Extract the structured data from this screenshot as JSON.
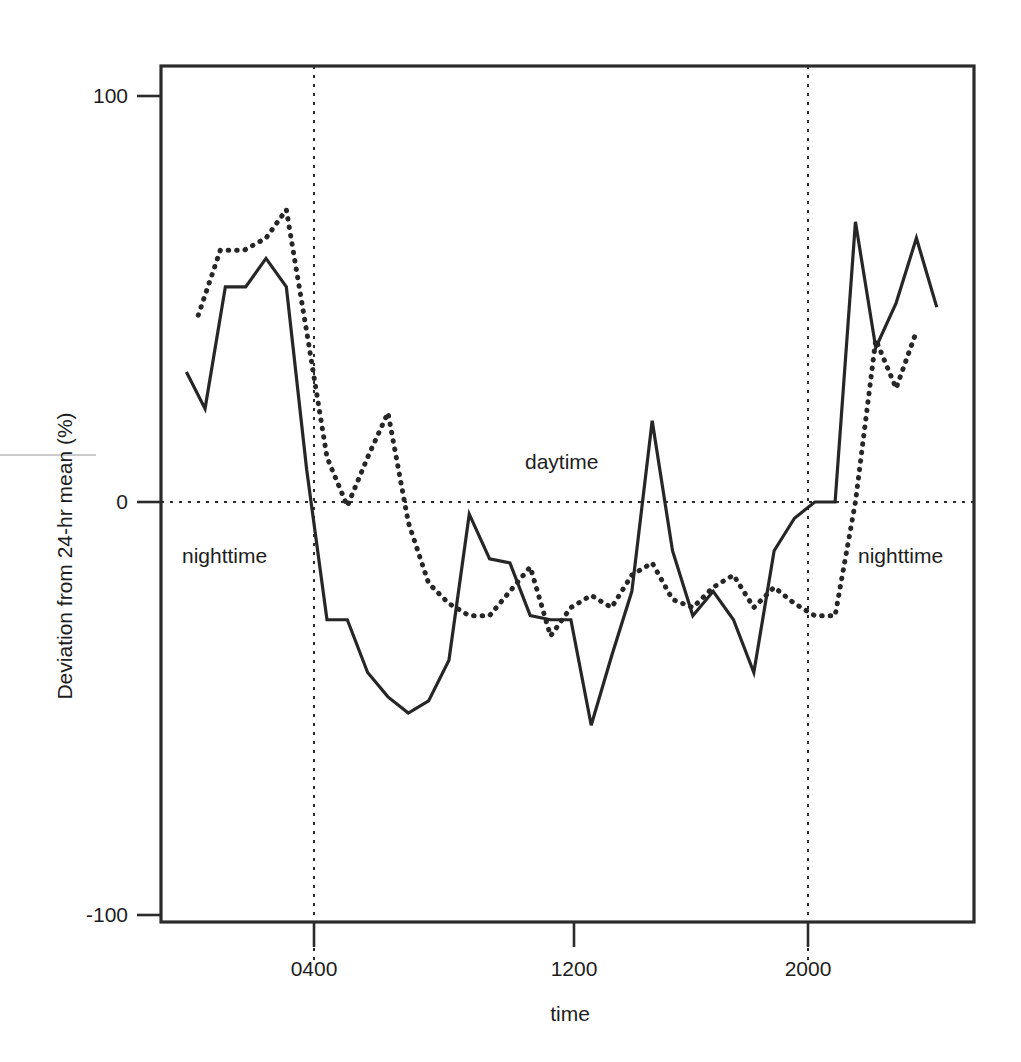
{
  "chart_data": {
    "type": "line",
    "title": "",
    "xlabel": "time",
    "ylabel": "Deviation from 24-hr mean (%)",
    "xlim": [
      0,
      2400
    ],
    "ylim": [
      -100,
      100
    ],
    "xticks": [
      400,
      1200,
      2000
    ],
    "xticklabels": [
      "0400",
      "1200",
      "2000"
    ],
    "yticks": [
      -100,
      0,
      100
    ],
    "yticklabels": [
      "-100",
      "0",
      "100"
    ],
    "grid": false,
    "zero_line": true,
    "legend": "none",
    "annotations": [
      {
        "text": "nighttime",
        "x": 290,
        "y": -17
      },
      {
        "text": "daytime",
        "x": 1100,
        "y": 10
      },
      {
        "text": "nighttime",
        "x": 2130,
        "y": -17
      }
    ],
    "vertical_markers": [
      {
        "label": "dawn",
        "x": 400
      },
      {
        "label": "dusk",
        "x": 2000
      }
    ],
    "series": [
      {
        "name": "solid",
        "style": "solid",
        "color": "#262626",
        "x": [
          75,
          130,
          190,
          250,
          310,
          370,
          430,
          490,
          550,
          610,
          670,
          730,
          790,
          850,
          910,
          970,
          1030,
          1090,
          1150,
          1210,
          1270,
          1330,
          1390,
          1450,
          1510,
          1570,
          1630,
          1690,
          1750,
          1810,
          1870,
          1930,
          1990,
          2050,
          2110,
          2170,
          2230,
          2290
        ],
        "y": [
          32,
          23,
          53,
          53,
          60,
          53,
          8,
          -29,
          -29,
          -42,
          -48,
          -52,
          -49,
          -39,
          -3,
          -14,
          -15,
          -28,
          -29,
          -29,
          -55,
          -38,
          -22,
          20,
          -12,
          -28,
          -22,
          -29,
          -42,
          -12,
          -4,
          0,
          0,
          69,
          38,
          49,
          65,
          48
        ]
      },
      {
        "name": "dotted",
        "style": "dotted",
        "color": "#262626",
        "x": [
          110,
          175,
          245,
          310,
          370,
          430,
          490,
          550,
          610,
          670,
          730,
          790,
          850,
          910,
          970,
          1030,
          1090,
          1150,
          1210,
          1270,
          1330,
          1390,
          1450,
          1510,
          1570,
          1630,
          1690,
          1750,
          1810,
          1870,
          1930,
          1990,
          2050,
          2110,
          2170,
          2230
        ],
        "y": [
          46,
          62,
          62,
          65,
          72,
          42,
          11,
          -1,
          11,
          22,
          -5,
          -20,
          -25,
          -28,
          -28,
          -22,
          -16,
          -33,
          -26,
          -23,
          -26,
          -18,
          -15,
          -24,
          -26,
          -21,
          -18,
          -26,
          -21,
          -25,
          -28,
          -28,
          0,
          40,
          28,
          42
        ]
      }
    ]
  },
  "axes": {
    "y_axis_title": "Deviation from 24-hr mean (%)",
    "x_axis_title": "time",
    "y_tick_100": "100",
    "y_tick_0": "0",
    "y_tick_neg100": "-100",
    "x_tick_0400": "0400",
    "x_tick_1200": "1200",
    "x_tick_2000": "2000"
  },
  "labels": {
    "nighttime_left": "nighttime",
    "daytime": "daytime",
    "nighttime_right": "nighttime"
  },
  "colors": {
    "line": "#262626",
    "frame": "#2b2b2b",
    "text": "#1d1d1d"
  }
}
